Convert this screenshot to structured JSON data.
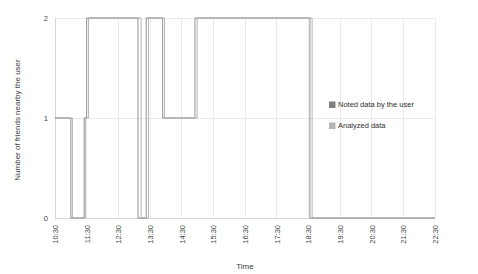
{
  "chart_data": {
    "type": "line",
    "title": "",
    "xlabel": "Time",
    "ylabel": "Number of friends nearby the user",
    "grid": true,
    "legend_position": "right",
    "xlim": [
      10.5,
      22.5
    ],
    "ylim": [
      0,
      2
    ],
    "yticks": [
      "0",
      "1",
      "2"
    ],
    "ytick_values": [
      0,
      1,
      2
    ],
    "categories": [
      "10:30",
      "11:30",
      "12:30",
      "13:30",
      "14:30",
      "15:30",
      "16:30",
      "17:30",
      "18:30",
      "19:30",
      "20:30",
      "21:30",
      "22:30"
    ],
    "x": [
      10.5,
      11.5,
      12.5,
      13.5,
      14.5,
      15.5,
      16.5,
      17.5,
      18.5,
      19.5,
      20.5,
      21.5,
      22.5
    ],
    "series": [
      {
        "name": "Noted data by the user",
        "color": "#808080",
        "step": "post",
        "points": [
          [
            10.5,
            1
          ],
          [
            11.0,
            1
          ],
          [
            11.0,
            0
          ],
          [
            11.42,
            0
          ],
          [
            11.42,
            1
          ],
          [
            11.5,
            1
          ],
          [
            11.5,
            2
          ],
          [
            13.12,
            2
          ],
          [
            13.12,
            0
          ],
          [
            13.38,
            0
          ],
          [
            13.38,
            2
          ],
          [
            13.9,
            2
          ],
          [
            13.9,
            1
          ],
          [
            14.92,
            1
          ],
          [
            14.92,
            2
          ],
          [
            18.55,
            2
          ],
          [
            18.55,
            0
          ],
          [
            22.5,
            0
          ]
        ]
      },
      {
        "name": "Analyzed data",
        "color": "#a8a8a8",
        "step": "post",
        "points": [
          [
            10.5,
            1
          ],
          [
            11.05,
            1
          ],
          [
            11.05,
            0
          ],
          [
            11.46,
            0
          ],
          [
            11.46,
            1
          ],
          [
            11.56,
            1
          ],
          [
            11.56,
            2
          ],
          [
            13.22,
            2
          ],
          [
            13.22,
            0
          ],
          [
            13.45,
            0
          ],
          [
            13.45,
            2
          ],
          [
            13.96,
            2
          ],
          [
            13.96,
            1
          ],
          [
            14.99,
            1
          ],
          [
            14.99,
            2
          ],
          [
            18.62,
            2
          ],
          [
            18.62,
            0
          ],
          [
            22.5,
            0
          ]
        ]
      }
    ]
  },
  "legend": {
    "items": [
      {
        "label": "Noted data by the user",
        "swatch": "#808080"
      },
      {
        "label": "Analyzed data",
        "swatch": "#b5b5b5"
      }
    ]
  }
}
